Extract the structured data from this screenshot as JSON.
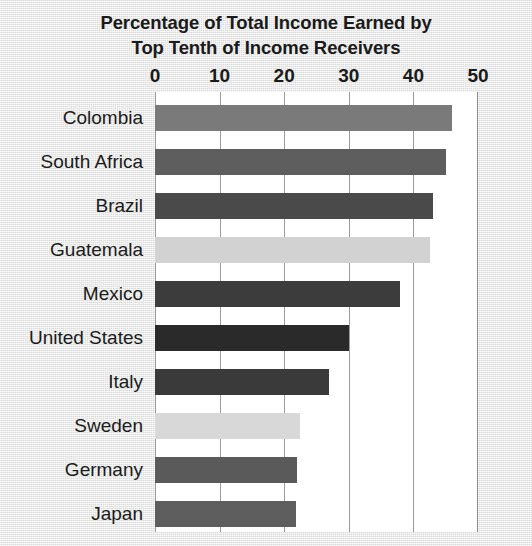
{
  "chart_data": {
    "type": "bar",
    "orientation": "horizontal",
    "title": "Percentage of Total Income Earned by Top Tenth of Income Receivers",
    "title_lines": [
      "Percentage of Total Income Earned by",
      "Top Tenth of Income Receivers"
    ],
    "xlabel": "",
    "ylabel": "",
    "xlim": [
      0,
      50
    ],
    "xticks": [
      0,
      10,
      20,
      30,
      40,
      50
    ],
    "xtick_labels": [
      "0",
      "10",
      "20",
      "30",
      "40",
      "50"
    ],
    "grid": "vertical",
    "legend": "none",
    "categories": [
      "Colombia",
      "South Africa",
      "Brazil",
      "Guatemala",
      "Mexico",
      "United States",
      "Italy",
      "Sweden",
      "Germany",
      "Japan"
    ],
    "values": [
      46,
      45,
      43,
      42.5,
      38,
      30,
      27,
      22.5,
      22,
      21.8
    ],
    "bar_colors": [
      "#7a7a7a",
      "#5e5e5e",
      "#4a4a4a",
      "#d2d2d2",
      "#3c3c3c",
      "#2a2a2a",
      "#3a3a3a",
      "#d8d8d8",
      "#5a5a5a",
      "#5e5e5e"
    ],
    "bars": [
      {
        "label": "Colombia",
        "value": 46,
        "color": "#7a7a7a"
      },
      {
        "label": "South Africa",
        "value": 45,
        "color": "#5e5e5e"
      },
      {
        "label": "Brazil",
        "value": 43,
        "color": "#4a4a4a"
      },
      {
        "label": "Guatemala",
        "value": 42.5,
        "color": "#d2d2d2"
      },
      {
        "label": "Mexico",
        "value": 38,
        "color": "#3c3c3c"
      },
      {
        "label": "United States",
        "value": 30,
        "color": "#2a2a2a"
      },
      {
        "label": "Italy",
        "value": 27,
        "color": "#3a3a3a"
      },
      {
        "label": "Sweden",
        "value": 22.5,
        "color": "#d8d8d8"
      },
      {
        "label": "Germany",
        "value": 22,
        "color": "#5a5a5a"
      },
      {
        "label": "Japan",
        "value": 21.8,
        "color": "#5e5e5e"
      }
    ],
    "colors": {
      "plot_background": "#ffffff",
      "figure_background": "#e4e4e4",
      "gridline": "#9a9a9a",
      "text": "#1a1a1a"
    }
  }
}
